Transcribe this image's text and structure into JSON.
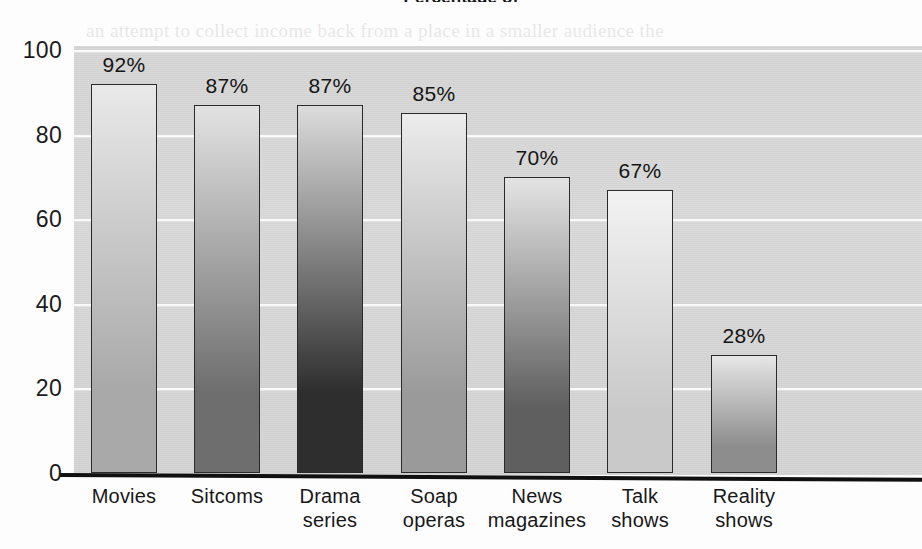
{
  "chart_data": {
    "type": "bar",
    "title": "Percentage of",
    "title_note": "title is clipped by the top edge of the scanned page",
    "subtitle": "",
    "xlabel": "",
    "ylabel": "",
    "categories": [
      "Movies",
      "Sitcoms",
      "Drama\nseries",
      "Soap\noperas",
      "News\nmagazines",
      "Talk\nshows",
      "Reality\nshows"
    ],
    "values": [
      92,
      87,
      87,
      85,
      70,
      67,
      28
    ],
    "value_labels": [
      "92%",
      "87%",
      "87%",
      "85%",
      "70%",
      "67%",
      "28%"
    ],
    "ylim": [
      0,
      100
    ],
    "ytick_labels": [
      "0",
      "20",
      "40",
      "60",
      "80",
      "100"
    ],
    "ytick_values": [
      0,
      20,
      40,
      60,
      80,
      100
    ],
    "grid": true,
    "grid_color": "#ffffff",
    "legend": "none",
    "panel_color": "#d7d7d7",
    "bar_shades": [
      {
        "category": "Movies",
        "top": "#e9e9e9",
        "bottom": "#a9a9a9"
      },
      {
        "category": "Sitcoms",
        "top": "#e2e2e2",
        "bottom": "#6e6e6e"
      },
      {
        "category": "Drama series",
        "top": "#dcdcdc",
        "bottom": "#2e2e2e"
      },
      {
        "category": "Soap operas",
        "top": "#ececec",
        "bottom": "#9a9a9a"
      },
      {
        "category": "News magazines",
        "top": "#e4e4e4",
        "bottom": "#5f5f5f"
      },
      {
        "category": "Talk shows",
        "top": "#f2f2f2",
        "bottom": "#c9c9c9"
      },
      {
        "category": "Reality shows",
        "top": "#e6e6e6",
        "bottom": "#8d8d8d"
      }
    ]
  },
  "ghost_text": {
    "lines": [
      "an attempt to collect income back from a place in a smaller audience the",
      "producers will have to go on adding the cost between the many lower",
      "and the. Many of these talk shows or that reality programs are chosen",
      "series for. The number of television news magazines has risen sharply"
    ]
  }
}
